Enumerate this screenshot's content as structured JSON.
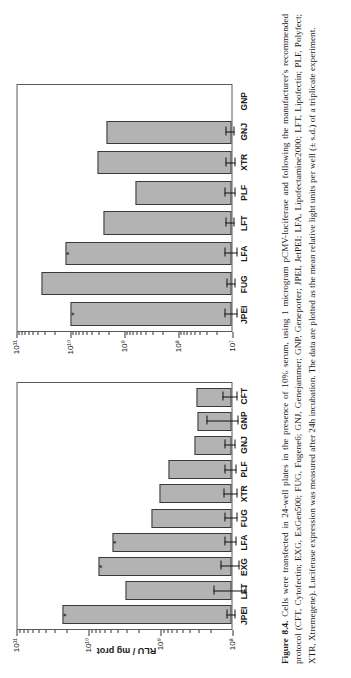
{
  "figure": {
    "number_label": "Figure 8.4.",
    "caption_text": "Cells were transfected in 24-well plates in the presence of 10% serum, using 1 microgram pCMV-luciferase and following the manufacturer's recommended protocol (CFT, Cytofectin; EXG, ExGen500; FUG, Fugene6; GNJ, Genejammer; GNP, Geneporter; JPEI, JetPEI; LFA, Lipofectamine2000; LFT, Lipofectin; PLF, Polyfect; XTR, Xtremegene). Luciferase expression was measured after 24h incubation. The data are plotted as the mean relative light units per well (± s.d.) of a triplicate experiment."
  },
  "colors": {
    "bar_fill": "#b3b3b3",
    "bar_stroke": "#3a3a3a",
    "axis": "#5a5a5a",
    "grid": "#4a4a4a"
  },
  "chart_data": [
    {
      "id": "hela",
      "type": "bar",
      "orientation": "vertical",
      "title": "HeLa cells",
      "xlabel": "",
      "ylabel": "RLU / mg prot",
      "yscale": "log",
      "ylim": [
        100000000,
        100000000000
      ],
      "ytick_labels": [
        "10⁸",
        "10⁹",
        "10¹⁰",
        "10¹¹"
      ],
      "ytick_values": [
        100000000,
        1000000000,
        10000000000,
        100000000000
      ],
      "grid": "dotted-horizontal-at-decades",
      "legend": "none",
      "annotation": "* potential proton sponge",
      "categories": [
        "JPEI",
        "LFT",
        "EXG",
        "LFA",
        "FUG",
        "XTR",
        "PLF",
        "GNJ",
        "GNP",
        "CFT"
      ],
      "values": [
        22000000000,
        3000000000,
        7000000000,
        4500000000,
        1300000000,
        1000000000,
        750000000,
        330000000,
        300000000,
        310000000
      ],
      "errors_low": [
        19000000000,
        1800000000,
        5200000000,
        3700000000,
        1050000000,
        800000000,
        620000000,
        280000000,
        230000000,
        250000000
      ],
      "errors_high": [
        25000000000,
        5200000000,
        9500000000,
        5400000000,
        1600000000,
        1250000000,
        900000000,
        400000000,
        640000000,
        400000000
      ],
      "starred_categories": [
        "JPEI",
        "EXG",
        "LFA"
      ]
    },
    {
      "id": "cho",
      "type": "bar",
      "orientation": "vertical",
      "title": "CHO cells",
      "xlabel": "",
      "ylabel": "",
      "yscale": "log",
      "ylim": [
        10000000,
        100000000000
      ],
      "ytick_labels": [
        "10⁷",
        "10⁸",
        "10⁹",
        "10¹⁰",
        "10¹¹"
      ],
      "ytick_values": [
        10000000,
        100000000,
        1000000000,
        10000000000,
        100000000000
      ],
      "grid": "dotted-horizontal-at-decades",
      "legend": "none",
      "annotation": "",
      "categories": [
        "JPEI",
        "FUG",
        "LFA",
        "LFT",
        "PLF",
        "XTR",
        "GNJ",
        "GNP"
      ],
      "values": [
        9500000000,
        33000000000,
        12000000000,
        2300000000,
        600000000,
        3000000000,
        2100000000,
        0
      ],
      "errors_low": [
        7000000000,
        27000000000,
        9000000000,
        1900000000,
        480000000,
        2400000000,
        1750000000,
        0
      ],
      "errors_high": [
        12500000000,
        40000000000,
        15500000000,
        2800000000,
        780000000,
        3700000000,
        2550000000,
        0
      ],
      "starred_categories": [
        "JPEI",
        "LFA"
      ]
    }
  ]
}
